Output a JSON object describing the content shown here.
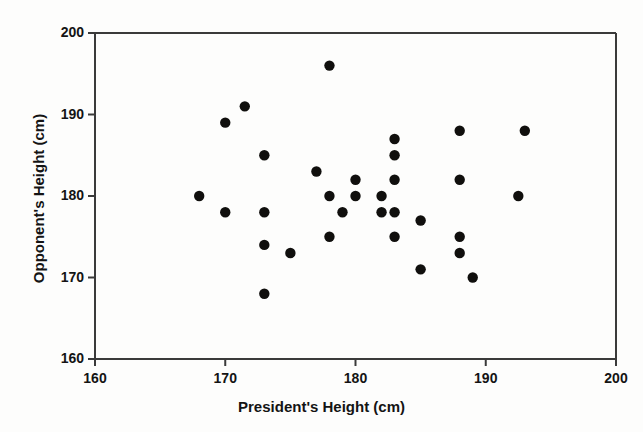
{
  "chart_data": {
    "type": "scatter",
    "title": "",
    "xlabel": "President's Height (cm)",
    "ylabel": "Opponent's Height (cm)",
    "xlim": [
      160,
      200
    ],
    "ylim": [
      160,
      200
    ],
    "xticks": [
      160,
      170,
      180,
      190,
      200
    ],
    "yticks": [
      160,
      170,
      180,
      190,
      200
    ],
    "xtick_labels": [
      "160",
      "170",
      "180",
      "190",
      "200"
    ],
    "ytick_labels": [
      "160",
      "170",
      "180",
      "190",
      "200"
    ],
    "grid": false,
    "legend": null,
    "marker": "filled-circle",
    "marker_color": "#100f0d",
    "frame_color": "#3a3a3a",
    "background_color": "#ffffff",
    "points": [
      {
        "x": 168,
        "y": 180
      },
      {
        "x": 170,
        "y": 189
      },
      {
        "x": 170,
        "y": 178
      },
      {
        "x": 171.5,
        "y": 191
      },
      {
        "x": 173,
        "y": 185
      },
      {
        "x": 173,
        "y": 178
      },
      {
        "x": 173,
        "y": 174
      },
      {
        "x": 173,
        "y": 168
      },
      {
        "x": 175,
        "y": 173
      },
      {
        "x": 177,
        "y": 183
      },
      {
        "x": 178,
        "y": 196
      },
      {
        "x": 178,
        "y": 180
      },
      {
        "x": 178,
        "y": 175
      },
      {
        "x": 179,
        "y": 178
      },
      {
        "x": 180,
        "y": 182
      },
      {
        "x": 180,
        "y": 180
      },
      {
        "x": 182,
        "y": 180
      },
      {
        "x": 182,
        "y": 178
      },
      {
        "x": 183,
        "y": 187
      },
      {
        "x": 183,
        "y": 185
      },
      {
        "x": 183,
        "y": 182
      },
      {
        "x": 183,
        "y": 178
      },
      {
        "x": 183,
        "y": 175
      },
      {
        "x": 185,
        "y": 177
      },
      {
        "x": 185,
        "y": 171
      },
      {
        "x": 188,
        "y": 188
      },
      {
        "x": 188,
        "y": 182
      },
      {
        "x": 188,
        "y": 175
      },
      {
        "x": 188,
        "y": 173
      },
      {
        "x": 189,
        "y": 170
      },
      {
        "x": 192.5,
        "y": 180
      },
      {
        "x": 193,
        "y": 188
      }
    ]
  }
}
